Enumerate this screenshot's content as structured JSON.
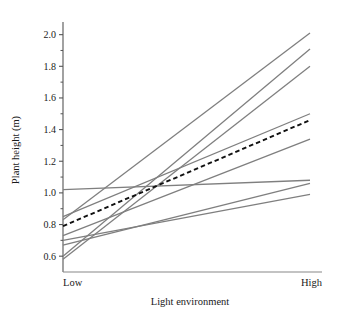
{
  "chart_data": {
    "type": "line",
    "title": "",
    "xlabel": "Light environment",
    "ylabel": "Plant height (m)",
    "categories": [
      "Low",
      "High"
    ],
    "x": [
      0,
      1
    ],
    "xlim": [
      0,
      1
    ],
    "ylim": [
      0.5,
      2.08
    ],
    "grid": false,
    "legend": null,
    "ytick_labels": [
      "0.6",
      "0.8",
      "1.0",
      "1.2",
      "1.4",
      "1.6",
      "1.8",
      "2.0"
    ],
    "ytick_values": [
      0.6,
      0.8,
      1.0,
      1.2,
      1.4,
      1.6,
      1.8,
      2.0
    ],
    "yminor_values": [
      0.7,
      0.9,
      1.1,
      1.3,
      1.5,
      1.7,
      1.9
    ],
    "series": [
      {
        "name": "genotype-1",
        "style": "solid",
        "color": "#7f7f7f",
        "values": [
          1.02,
          1.08
        ]
      },
      {
        "name": "genotype-2",
        "style": "solid",
        "color": "#7f7f7f",
        "values": [
          0.85,
          1.5
        ]
      },
      {
        "name": "genotype-3",
        "style": "solid",
        "color": "#7f7f7f",
        "values": [
          0.83,
          2.01
        ]
      },
      {
        "name": "genotype-4",
        "style": "solid",
        "color": "#7f7f7f",
        "values": [
          0.73,
          1.34
        ]
      },
      {
        "name": "genotype-5",
        "style": "solid",
        "color": "#7f7f7f",
        "values": [
          0.7,
          0.99
        ]
      },
      {
        "name": "genotype-6",
        "style": "solid",
        "color": "#7f7f7f",
        "values": [
          0.67,
          1.06
        ]
      },
      {
        "name": "genotype-7",
        "style": "solid",
        "color": "#7f7f7f",
        "values": [
          0.6,
          1.91
        ]
      },
      {
        "name": "genotype-8",
        "style": "solid",
        "color": "#7f7f7f",
        "values": [
          0.58,
          1.8
        ]
      },
      {
        "name": "population-mean",
        "style": "dashed",
        "color": "#111111",
        "values": [
          0.79,
          1.46
        ]
      }
    ]
  },
  "axes": {
    "y_title": "Plant height (m)",
    "x_title": "Light environment",
    "x_cat_low": "Low",
    "x_cat_high": "High"
  },
  "colors": {
    "background": "#ffffff",
    "axis": "#555555",
    "line_gray": "#7f7f7f",
    "line_mean": "#111111",
    "text": "#1a1a1a"
  }
}
